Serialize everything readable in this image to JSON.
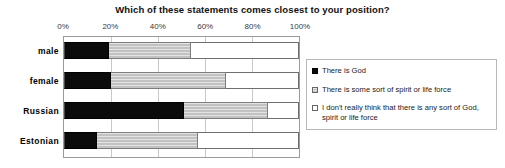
{
  "chart_data": {
    "type": "bar",
    "orientation": "horizontal",
    "stacked": true,
    "stack_mode": "percent",
    "title": "Which of these statements comes closest to your position?",
    "xlabel": "",
    "ylabel": "",
    "xlim": [
      0,
      100
    ],
    "xticks": [
      0,
      20,
      40,
      60,
      80,
      100
    ],
    "xtick_labels": [
      "0%",
      "20%",
      "40%",
      "60%",
      "80%",
      "100%"
    ],
    "grid": true,
    "legend_position": "right",
    "categories": [
      "male",
      "female",
      "Russian",
      "Estonian"
    ],
    "series": [
      {
        "name": "There is God",
        "swatch": "solid-black",
        "color": "#0b0b0b",
        "values": [
          19,
          20,
          51,
          14
        ]
      },
      {
        "name": "There is some sort of spirit or life force",
        "swatch": "hatched-gray",
        "color": "#c2c2c2",
        "values": [
          35,
          49,
          36,
          43
        ]
      },
      {
        "name": "I don't really think that there is any sort of God, spirit or life force",
        "swatch": "empty-white",
        "color": "#ffffff",
        "values": [
          46,
          31,
          13,
          43
        ]
      }
    ]
  },
  "legend": {
    "items": [
      "There is God",
      "There is some sort of spirit or life force",
      "I don't really think that there is any sort of God, spirit or life force"
    ]
  }
}
